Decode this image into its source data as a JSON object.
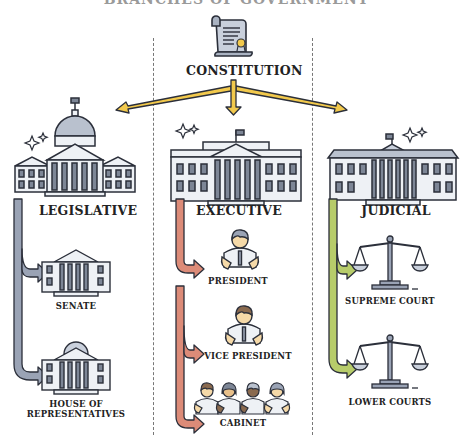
{
  "title": "BRANCHES OF GOVERNMENT",
  "constitution": {
    "label": "CONSTITUTION",
    "icon": "scroll-document-icon"
  },
  "colors": {
    "connector": "#f2c94c",
    "legislative": "#9aa3b5",
    "executive": "#dc8b78",
    "judicial": "#b7cc6a",
    "outline": "#2b2f3a",
    "building_fill": "#eef1f5",
    "building_dark": "#7d8696"
  },
  "branches": [
    {
      "id": "legislative",
      "label": "LEGISLATIVE",
      "icon": "capitol-building-icon",
      "children": [
        {
          "label": "SENATE",
          "icon": "senate-building-icon"
        },
        {
          "label": "HOUSE OF",
          "label2": "REPRESENTATIVES",
          "icon": "domed-building-icon"
        }
      ]
    },
    {
      "id": "executive",
      "label": "EXECUTIVE",
      "icon": "white-house-icon",
      "children": [
        {
          "label": "PRESIDENT",
          "icon": "person-icon"
        },
        {
          "label": "VICE PRESIDENT",
          "icon": "person-icon"
        },
        {
          "label": "CABINET",
          "icon": "group-people-icon"
        }
      ]
    },
    {
      "id": "judicial",
      "label": "JUDICIAL",
      "icon": "courthouse-icon",
      "children": [
        {
          "label": "SUPREME COURT",
          "icon": "scales-of-justice-icon"
        },
        {
          "label": "LOWER COURTS",
          "icon": "scales-of-justice-icon"
        }
      ]
    }
  ]
}
